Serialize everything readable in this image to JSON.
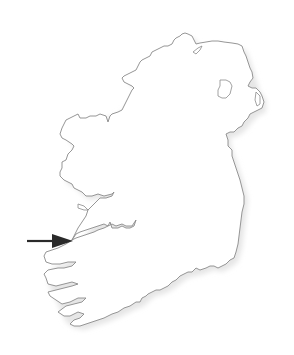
{
  "map": {
    "subject": "Outline map of Ireland",
    "background_color": "#ffffff",
    "coast_stroke_color": "#8a8a8a",
    "land_fill_color": "#ffffff",
    "shadow_color": "#e6e6e6",
    "features": [
      {
        "name": "island-of-ireland-outline",
        "type": "coastline"
      },
      {
        "name": "lough-neagh",
        "type": "lake"
      },
      {
        "name": "shannon-estuary",
        "type": "estuary",
        "highlighted_by_arrow": true
      }
    ]
  },
  "annotation": {
    "type": "arrow",
    "direction": "right",
    "color": "#2a2a2a",
    "points_to": "shannon-estuary",
    "label": ""
  }
}
